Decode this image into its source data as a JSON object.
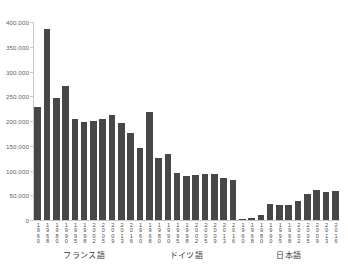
{
  "chart_data": {
    "type": "bar",
    "title": "",
    "xlabel": "",
    "ylabel": "",
    "ylim": [
      0,
      400000
    ],
    "ytick_labels": [
      "400,000",
      "350,000",
      "300,000",
      "250,000",
      "200,000",
      "150,000",
      "100,000",
      "50,000",
      "0"
    ],
    "ytick_values": [
      400000,
      350000,
      300000,
      250000,
      200000,
      150000,
      100000,
      50000,
      0
    ],
    "grid": false,
    "legend": "none",
    "bar_color": "#474747",
    "axis_color": "#c9c9c9",
    "categories": [
      "1960",
      "1968",
      "1980",
      "1990",
      "1995",
      "1998",
      "2002",
      "2005",
      "2009",
      "2013",
      "2016"
    ],
    "groups": [
      {
        "name": "フランス語",
        "categories": [
          "1960",
          "1968",
          "1980",
          "1990",
          "1995",
          "1998",
          "2002",
          "2005",
          "2009",
          "2013",
          "2016"
        ],
        "values": [
          229000,
          385000,
          247000,
          271000,
          205000,
          198000,
          201000,
          205000,
          213000,
          197000,
          176000
        ]
      },
      {
        "name": "ドイツ語",
        "categories": [
          "1960",
          "1968",
          "1980",
          "1990",
          "1995",
          "1998",
          "2002",
          "2005",
          "2009",
          "2013",
          "2016"
        ],
        "values": [
          146000,
          219000,
          126000,
          134000,
          94000,
          88000,
          90000,
          93000,
          93000,
          85000,
          80000
        ]
      },
      {
        "name": "日本語",
        "categories": [
          "1960",
          "1968",
          "1980",
          "1990",
          "1995",
          "1998",
          "2002",
          "2005",
          "2009",
          "2013",
          "2016"
        ],
        "values": [
          1000,
          4000,
          11000,
          33000,
          31000,
          30000,
          38000,
          53000,
          61000,
          56000,
          58000
        ]
      }
    ]
  }
}
